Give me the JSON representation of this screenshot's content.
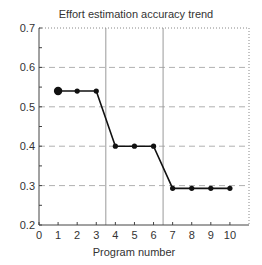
{
  "chart_data": {
    "type": "line",
    "title": "Effort estimation accuracy trend",
    "xlabel": "Program number",
    "ylabel": "",
    "xlim": [
      0,
      11
    ],
    "ylim": [
      0.2,
      0.7
    ],
    "x_ticks": [
      0,
      1,
      2,
      3,
      4,
      5,
      6,
      7,
      8,
      9,
      10
    ],
    "y_ticks": [
      "0.2",
      "0.3",
      "0.4",
      "0.5",
      "0.6",
      "0.7"
    ],
    "y_minor_step": 0.05,
    "grid": "horizontal dashed at 0.3, 0.4, 0.5, 0.6",
    "vertical_separators": [
      3.5,
      6.5
    ],
    "series": [
      {
        "name": "Accuracy",
        "x": [
          1,
          2,
          3,
          4,
          5,
          6,
          7,
          8,
          9,
          10
        ],
        "values": [
          0.54,
          0.54,
          0.54,
          0.4,
          0.4,
          0.4,
          0.293,
          0.293,
          0.293,
          0.293
        ],
        "color": "#111111",
        "first_marker_large": true
      }
    ],
    "legend": "none"
  },
  "colors": {
    "line": "#111111",
    "grid": "#b0b0b0",
    "separator": "#9a9a9a",
    "axis": "#444444"
  }
}
